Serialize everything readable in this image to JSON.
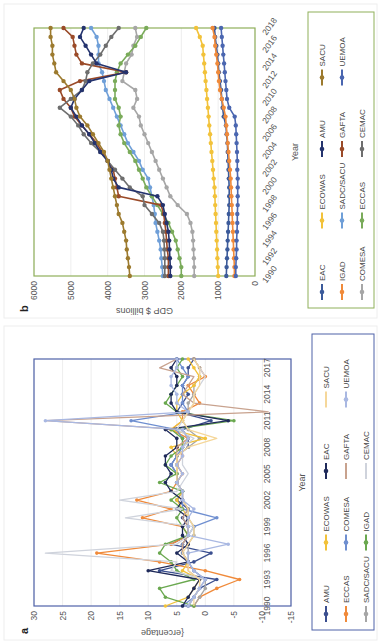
{
  "figure": {
    "orientation": "rotated 90 degrees (page turned sideways)"
  },
  "chart_data": [
    {
      "panel": "a",
      "type": "line",
      "title": "",
      "xlabel": "Year",
      "ylabel": "{ercentage",
      "ylim": [
        -15,
        30
      ],
      "yticks": [
        30,
        25,
        20,
        15,
        10,
        5,
        0,
        -5,
        -10,
        -15
      ],
      "xticks": [
        "1990",
        "1993",
        "1996",
        "1999",
        "2002",
        "2005",
        "2008",
        "2011",
        "2014",
        "2017"
      ],
      "x": [
        1990,
        1991,
        1992,
        1993,
        1994,
        1995,
        1996,
        1997,
        1998,
        1999,
        2000,
        2001,
        2002,
        2003,
        2004,
        2005,
        2006,
        2007,
        2008,
        2009,
        2010,
        2011,
        2012,
        2013,
        2014,
        2015,
        2016,
        2017,
        2018
      ],
      "grid": true,
      "legend_position": "bottom",
      "frame_color": "#4f62a8",
      "series": [
        {
          "name": "AMU",
          "color": "#3b4f8f",
          "marker": true,
          "values": [
            3,
            2,
            1,
            -2,
            8,
            2,
            -1,
            6,
            3,
            3,
            4,
            3,
            5,
            4,
            5,
            5,
            6,
            5,
            3,
            3,
            4,
            -1,
            5,
            4,
            3,
            4,
            3,
            3,
            2
          ]
        },
        {
          "name": "ECCAS",
          "color": "#f08a3a",
          "marker": true,
          "values": [
            2,
            1,
            -2,
            -6,
            0,
            8,
            19,
            6,
            3,
            4,
            11,
            6,
            12,
            6,
            5,
            4,
            5,
            4,
            5,
            3,
            6,
            4,
            4,
            1,
            2,
            3,
            0,
            1,
            2
          ]
        },
        {
          "name": "SADC/SACU",
          "color": "#a6a6a6",
          "marker": true,
          "values": [
            2,
            1,
            0,
            0,
            2,
            3,
            3,
            3,
            2,
            2,
            3,
            3,
            4,
            4,
            5,
            5,
            5,
            5,
            3,
            1,
            3,
            4,
            3,
            3,
            2,
            2,
            1,
            1,
            2
          ]
        },
        {
          "name": "ECOWAS",
          "color": "#f2c23a",
          "marker": true,
          "values": [
            7,
            3,
            2,
            1,
            4,
            3,
            4,
            4,
            3,
            3,
            3,
            4,
            5,
            4,
            5,
            5,
            5,
            5,
            6,
            0,
            6,
            4,
            5,
            5,
            4,
            2,
            1,
            2,
            3
          ]
        },
        {
          "name": "COMESA",
          "color": "#6f8fd0",
          "marker": true,
          "values": [
            4,
            2,
            1,
            0,
            2,
            3,
            4,
            4,
            3,
            2,
            -2,
            4,
            4,
            4,
            5,
            5,
            6,
            5,
            4,
            4,
            5,
            13,
            3,
            4,
            4,
            4,
            3,
            4,
            5
          ]
        },
        {
          "name": "IGAD",
          "color": "#6aa84f",
          "marker": true,
          "values": [
            2,
            7,
            8,
            2,
            5,
            6,
            8,
            7,
            3,
            4,
            5,
            4,
            6,
            4,
            8,
            5,
            7,
            6,
            4,
            4,
            6,
            -5,
            5,
            7,
            6,
            5,
            4,
            5,
            4
          ]
        },
        {
          "name": "EAC",
          "color": "#1f2a5a",
          "marker": true,
          "values": [
            4,
            3,
            2,
            1,
            10,
            3,
            5,
            3,
            4,
            4,
            3,
            5,
            4,
            6,
            7,
            6,
            7,
            7,
            5,
            5,
            7,
            -4,
            5,
            6,
            6,
            5,
            5,
            6,
            5
          ]
        },
        {
          "name": "GAFTA",
          "color": "#c8a28e",
          "marker": false,
          "values": [
            3,
            2,
            1,
            1,
            3,
            3,
            4,
            4,
            3,
            3,
            4,
            3,
            4,
            4,
            5,
            4,
            5,
            5,
            5,
            3,
            4,
            28,
            -11,
            2,
            4,
            3,
            2,
            8,
            5
          ]
        },
        {
          "name": "CEMAC",
          "color": "#cfd3dc",
          "marker": false,
          "values": [
            3,
            2,
            1,
            0,
            6,
            5,
            28,
            5,
            3,
            2,
            14,
            4,
            15,
            5,
            4,
            3,
            4,
            4,
            4,
            2,
            5,
            4,
            3,
            2,
            2,
            1,
            0,
            1,
            2
          ]
        },
        {
          "name": "SACU",
          "color": "#f5d79a",
          "marker": false,
          "values": [
            2,
            2,
            1,
            1,
            3,
            3,
            4,
            3,
            2,
            2,
            3,
            3,
            4,
            4,
            5,
            5,
            5,
            5,
            3,
            -2,
            3,
            4,
            3,
            2,
            2,
            1,
            1,
            1,
            2
          ]
        },
        {
          "name": "UEMOA",
          "color": "#a9b8e2",
          "marker": true,
          "values": [
            3,
            2,
            1,
            0,
            2,
            3,
            3,
            -4,
            3,
            3,
            3,
            2,
            4,
            4,
            5,
            4,
            5,
            4,
            4,
            3,
            4,
            28,
            3,
            5,
            5,
            6,
            6,
            5,
            5
          ]
        }
      ]
    },
    {
      "panel": "b",
      "type": "line",
      "title": "",
      "xlabel": "Year",
      "ylabel": "GDP $ billions",
      "ylim": [
        0,
        6000
      ],
      "yticks": [
        6000,
        5000,
        4000,
        3000,
        2000,
        1000,
        0
      ],
      "xticks": [
        "1990",
        "1992",
        "1994",
        "1996",
        "1998",
        "2000",
        "2002",
        "2004",
        "2006",
        "2008",
        "2010",
        "2012",
        "2014",
        "2016",
        "2018"
      ],
      "x": [
        1990,
        1991,
        1992,
        1993,
        1994,
        1995,
        1996,
        1997,
        1998,
        1999,
        2000,
        2001,
        2002,
        2003,
        2004,
        2005,
        2006,
        2007,
        2008,
        2009,
        2010,
        2011,
        2012,
        2013,
        2014,
        2015,
        2016,
        2017,
        2018
      ],
      "grid": true,
      "legend_position": "bottom",
      "frame_color": "#8fb05a",
      "series": [
        {
          "name": "EAC",
          "color": "#3b5a9a",
          "values": [
            780,
            770,
            760,
            750,
            740,
            730,
            720,
            710,
            700,
            700,
            700,
            710,
            720,
            730,
            740,
            750,
            770,
            790,
            850,
            880,
            900,
            920,
            950,
            980,
            1000,
            1020,
            1050,
            1080,
            1100
          ]
        },
        {
          "name": "IGAD",
          "color": "#f08a3a",
          "values": [
            560,
            560,
            570,
            580,
            590,
            600,
            610,
            620,
            630,
            640,
            650,
            660,
            680,
            700,
            720,
            740,
            760,
            780,
            800,
            850,
            900,
            950,
            980,
            1000,
            1020,
            1050,
            1080,
            1100,
            1150
          ]
        },
        {
          "name": "COMESA",
          "color": "#a6a6a6",
          "values": [
            1650,
            1650,
            1660,
            1670,
            1680,
            1700,
            1750,
            1850,
            2100,
            2300,
            2400,
            2500,
            2600,
            2700,
            2800,
            2900,
            3000,
            3100,
            3150,
            3300,
            3200,
            3250,
            3600,
            3550,
            3500,
            3350,
            3300,
            3200,
            3250
          ]
        },
        {
          "name": "ECOWAS",
          "color": "#f2c23a",
          "values": [
            1000,
            1010,
            1020,
            1030,
            1040,
            1050,
            1060,
            1070,
            1080,
            1090,
            1100,
            1120,
            1140,
            1160,
            1180,
            1200,
            1220,
            1240,
            1260,
            1280,
            1300,
            1320,
            1340,
            1360,
            1380,
            1400,
            1420,
            1500,
            1600
          ]
        },
        {
          "name": "SADC/SACU",
          "color": "#6f9fd8",
          "values": [
            2500,
            2520,
            2540,
            2560,
            2600,
            2650,
            2700,
            2720,
            2750,
            2800,
            2850,
            2900,
            3050,
            3150,
            3300,
            3450,
            3550,
            3650,
            3750,
            3850,
            3950,
            4050,
            4100,
            4150,
            4250,
            4250,
            4250,
            4300,
            4450
          ]
        },
        {
          "name": "ECCAS",
          "color": "#7aab5a",
          "values": [
            2000,
            2000,
            2050,
            2100,
            2150,
            2250,
            2350,
            2500,
            2650,
            2800,
            2950,
            3050,
            3150,
            3250,
            3400,
            3550,
            3650,
            3700,
            3650,
            3700,
            3800,
            3800,
            3800,
            3750,
            3650,
            3450,
            3250,
            3100,
            2950
          ]
        },
        {
          "name": "GAFTA",
          "color": "#9a4a28",
          "values": [
            2350,
            2350,
            2350,
            2380,
            2400,
            2420,
            2450,
            2480,
            2550,
            3700,
            3750,
            3800,
            3850,
            4000,
            4150,
            4300,
            4500,
            4700,
            4900,
            5000,
            5200,
            5300,
            4750,
            3500,
            4700,
            4850,
            4900,
            4950,
            5200
          ]
        },
        {
          "name": "CEMAC",
          "color": "#6e6e6e",
          "values": [
            2450,
            2450,
            2450,
            2460,
            2470,
            2500,
            2600,
            2800,
            3000,
            3050,
            3400,
            3600,
            3800,
            4000,
            4200,
            4450,
            4650,
            4800,
            5000,
            5300,
            5000,
            4700,
            4600,
            4550,
            4400,
            4200,
            4050,
            3900,
            3700
          ]
        },
        {
          "name": "AMU",
          "color": "#24336e",
          "values": [
            2300,
            2300,
            2310,
            2320,
            2330,
            2350,
            2400,
            2450,
            2500,
            2650,
            3700,
            3850,
            3900,
            4000,
            4200,
            4350,
            4500,
            4700,
            4850,
            5000,
            4900,
            4700,
            4500,
            3500,
            4300,
            4450,
            4600,
            4750,
            4650
          ]
        },
        {
          "name": "SACU",
          "color": "#9c7a2e",
          "values": [
            3400,
            3420,
            3450,
            3480,
            3500,
            3550,
            3600,
            3700,
            3750,
            3800,
            3850,
            3900,
            3950,
            4000,
            4100,
            4250,
            4400,
            4550,
            4750,
            4850,
            4900,
            5000,
            5200,
            5400,
            5450,
            5500,
            5500,
            5550,
            5550
          ]
        },
        {
          "name": "UEMOA",
          "color": "#4a66b0",
          "values": [
            520,
            520,
            510,
            500,
            500,
            490,
            480,
            480,
            470,
            470,
            470,
            470,
            480,
            480,
            490,
            500,
            510,
            520,
            550,
            700,
            760,
            780,
            800,
            820,
            840,
            860,
            880,
            900,
            920
          ]
        }
      ]
    }
  ],
  "panels": {
    "a": {
      "label": "a",
      "xlabel": "Year",
      "ylabel": "{ercentage",
      "legend": [
        "AMU",
        "ECCAS",
        "SADC/SACU",
        "ECOWAS",
        "COMESA",
        "IGAD",
        "EAC",
        "GAFTA",
        "CEMAC",
        "SACU",
        "UEMOA"
      ]
    },
    "b": {
      "label": "b",
      "xlabel": "Year",
      "ylabel": "GDP $ billions",
      "legend": [
        "EAC",
        "IGAD",
        "COMESA",
        "ECOWAS",
        "SADC/SACU",
        "ECCAS",
        "AMU",
        "GAFTA",
        "CEMAC",
        "SACU",
        "UEMOA"
      ]
    }
  }
}
